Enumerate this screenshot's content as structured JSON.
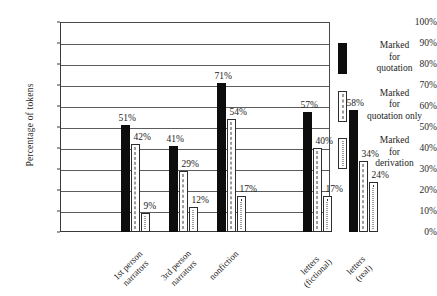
{
  "chart_data": {
    "type": "bar",
    "title": "",
    "xlabel": "",
    "ylabel": "Percentage of tokens",
    "ylim": [
      0,
      100
    ],
    "ytick_labels": [
      "100%",
      "90%",
      "80%",
      "70%",
      "60%",
      "50%",
      "40%",
      "30%",
      "20%",
      "10%",
      "0%"
    ],
    "ytick_values": [
      100,
      90,
      80,
      70,
      60,
      50,
      40,
      30,
      20,
      10,
      0
    ],
    "grid": true,
    "legend_position": "right",
    "categories": [
      "1st person narrators",
      "3rd person narrators",
      "nonfiction",
      "letters (fictional)",
      "letters (real)"
    ],
    "category_lines": [
      [
        "1st person",
        "narrators"
      ],
      [
        "3rd person",
        "narrators"
      ],
      [
        "nonfiction"
      ],
      [
        "letters",
        "(fictional)"
      ],
      [
        "letters",
        "(real)"
      ]
    ],
    "series": [
      {
        "name": "Marked for quotation",
        "pattern": "solid",
        "values": [
          51,
          41,
          71,
          57,
          58
        ],
        "labels": [
          "51%",
          "41%",
          "71%",
          "57%",
          "58%"
        ]
      },
      {
        "name": "Marked for quotation only",
        "pattern": "dashed",
        "values": [
          42,
          29,
          54,
          40,
          34
        ],
        "labels": [
          "42%",
          "29%",
          "54%",
          "40%",
          "34%"
        ]
      },
      {
        "name": "Marked for derivation",
        "pattern": "dotted",
        "values": [
          9,
          12,
          17,
          17,
          24
        ],
        "labels": [
          "9%",
          "12%",
          "17%",
          "17%",
          "24%"
        ]
      }
    ],
    "legend_entries": [
      {
        "pattern": "solid",
        "lines": [
          "Marked",
          "for",
          "quotation"
        ]
      },
      {
        "pattern": "dashed",
        "lines": [
          "Marked",
          "for",
          "quotation only"
        ]
      },
      {
        "pattern": "dotted",
        "lines": [
          "Marked",
          "for",
          "derivation"
        ]
      }
    ],
    "colors": {
      "solid_fill": "#0d0d0d",
      "open_fill": "#ffffff",
      "outline": "#2e2e2e",
      "grid": "#5c5c5c",
      "axis": "#3a3a3a",
      "text": "#1c1c1c",
      "background": "#ffffff"
    }
  }
}
